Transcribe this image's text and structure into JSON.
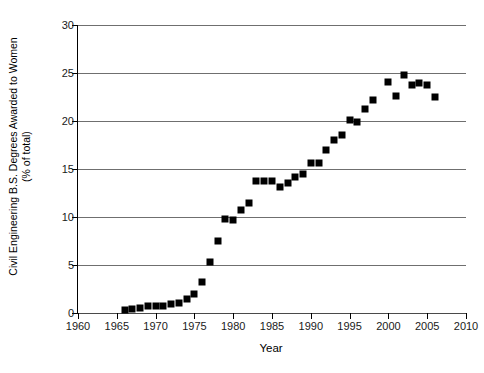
{
  "chart_data": {
    "type": "scatter",
    "title": "",
    "xlabel": "Year",
    "ylabel": "Civil Engineering B.S. Degrees Awarded to Women (% of total)",
    "ylabel_line1": "Civil Engineering B.S. Degrees Awarded to Women",
    "ylabel_line2": "(% of total)",
    "xlim": [
      1960,
      2010
    ],
    "ylim": [
      0,
      30
    ],
    "xticks": [
      1960,
      1965,
      1970,
      1975,
      1980,
      1985,
      1990,
      1995,
      2000,
      2005,
      2010
    ],
    "yticks": [
      0,
      5,
      10,
      15,
      20,
      25,
      30
    ],
    "grid": "horizontal",
    "legend": "none",
    "marker": "filled-square",
    "marker_color": "#000000",
    "x": [
      1966,
      1967,
      1968,
      1969,
      1970,
      1971,
      1972,
      1973,
      1974,
      1975,
      1976,
      1977,
      1978,
      1979,
      1980,
      1981,
      1982,
      1983,
      1984,
      1985,
      1986,
      1987,
      1988,
      1989,
      1990,
      1991,
      1992,
      1993,
      1994,
      1995,
      1996,
      1997,
      1998,
      2000,
      2001,
      2002,
      2003,
      2004,
      2005,
      2006
    ],
    "y": [
      0.3,
      0.4,
      0.5,
      0.7,
      0.7,
      0.7,
      0.9,
      1.0,
      1.5,
      2.0,
      3.2,
      5.3,
      7.5,
      9.8,
      9.7,
      10.7,
      11.5,
      13.7,
      13.7,
      13.7,
      13.1,
      13.5,
      14.2,
      14.5,
      15.6,
      15.6,
      17.0,
      18.0,
      18.5,
      20.1,
      19.9,
      21.2,
      22.2,
      24.1,
      22.6,
      24.8,
      23.8,
      24.0,
      23.7,
      22.5
    ]
  },
  "axes": {
    "x_tick_labels": [
      "1960",
      "1965",
      "1970",
      "1975",
      "1980",
      "1985",
      "1990",
      "1995",
      "2000",
      "2005",
      "2010"
    ],
    "y_tick_labels": [
      "0",
      "5",
      "10",
      "15",
      "20",
      "25",
      "30"
    ]
  }
}
